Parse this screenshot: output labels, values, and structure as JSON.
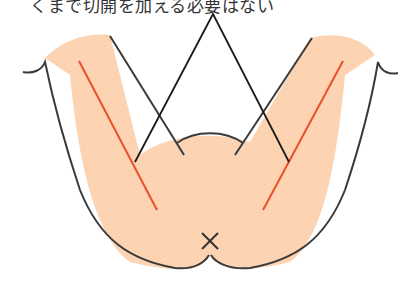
{
  "caption": "くまで切開を加える必要はない",
  "colors": {
    "skin": "#fdd5b4",
    "outline": "#3a3a3a",
    "incision": "#e8502a",
    "pointer": "#1a1a1a"
  },
  "marks": {
    "center_mark": "×"
  }
}
